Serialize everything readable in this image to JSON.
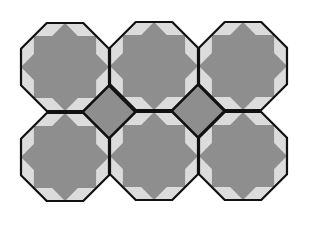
{
  "colors": {
    "background": "#ffffff",
    "star": "#8e8e8e",
    "field": "#dcdcdc",
    "diamond": "#8e8e8e",
    "outline": "#111111"
  },
  "grid": {
    "columns": [
      65,
      154,
      243
    ],
    "rows": [
      67,
      157
    ],
    "apothem": 44,
    "stroke_width": 2.2
  },
  "tiles": [
    {
      "id": "octagon-r1-c1",
      "cx": 65,
      "cy": 67
    },
    {
      "id": "octagon-r1-c2",
      "cx": 154,
      "cy": 66
    },
    {
      "id": "octagon-r1-c3",
      "cx": 243,
      "cy": 66
    },
    {
      "id": "octagon-r2-c1",
      "cx": 65,
      "cy": 157
    },
    {
      "id": "octagon-r2-c2",
      "cx": 154,
      "cy": 156
    },
    {
      "id": "octagon-r2-c3",
      "cx": 243,
      "cy": 156
    }
  ],
  "diamonds": [
    {
      "id": "diamond-1",
      "cx": 109,
      "cy": 112
    },
    {
      "id": "diamond-2",
      "cx": 198,
      "cy": 111
    }
  ]
}
